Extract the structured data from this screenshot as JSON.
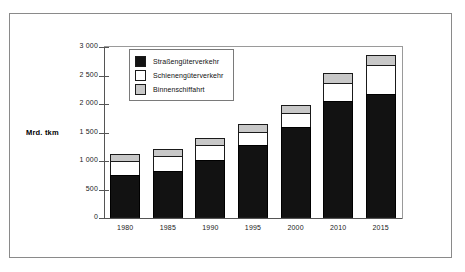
{
  "chart_data": {
    "type": "bar",
    "subtype": "stacked",
    "title": "",
    "xlabel": "",
    "ylabel": "Mrd. tkm",
    "ylim": [
      0,
      3000
    ],
    "ytick_labels": [
      "3 000",
      "2 500",
      "2 000",
      "1 500",
      "1 000",
      "500",
      "0"
    ],
    "ytick_values": [
      3000,
      2500,
      2000,
      1500,
      1000,
      500,
      0
    ],
    "grid": false,
    "legend_position": "upper-left-inside",
    "categories": [
      "1980",
      "1985",
      "1990",
      "1995",
      "2000",
      "2010",
      "2015"
    ],
    "series": [
      {
        "name": "Straßengüterverkehr",
        "color": "#121212",
        "values": [
          760,
          825,
          1025,
          1280,
          1605,
          2050,
          2180
        ]
      },
      {
        "name": "Schienengüterverkehr",
        "color": "#ffffff",
        "values": [
          245,
          255,
          250,
          230,
          245,
          320,
          500
        ]
      },
      {
        "name": "Binnenschiffahrt",
        "color": "#c8c8c8",
        "values": [
          125,
          130,
          130,
          145,
          140,
          170,
          180
        ]
      }
    ],
    "totals": [
      1130,
      1210,
      1405,
      1655,
      1990,
      2540,
      2860
    ]
  },
  "legend": {
    "entries": [
      {
        "label": "Straßengüterverkehr",
        "swatch": "road"
      },
      {
        "label": "Schienengüterverkehr",
        "swatch": "rail"
      },
      {
        "label": "Binnenschiffahrt",
        "swatch": "inland"
      }
    ]
  },
  "axis": {
    "value_axis_title": "Mrd. tkm"
  }
}
